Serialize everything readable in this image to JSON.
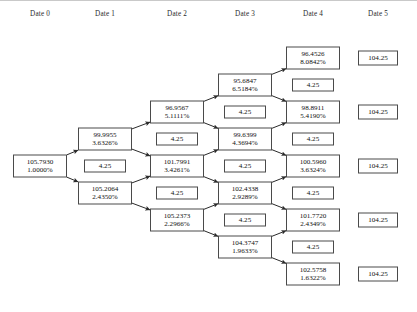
{
  "figure": {
    "type": "binomial-interest-rate-tree",
    "border_color": "#c9c9c9",
    "node_border_color": "#4a4a4a",
    "edge_color": "#2b2b2b"
  },
  "headers": [
    {
      "label": "Date 0",
      "x": 40
    },
    {
      "label": "Date 1",
      "x": 105
    },
    {
      "label": "Date 2",
      "x": 177
    },
    {
      "label": "Date 3",
      "x": 245
    },
    {
      "label": "Date 4",
      "x": 313
    },
    {
      "label": "Date 5",
      "x": 378
    }
  ],
  "columns": [
    {
      "date": "Date 0",
      "x": 40,
      "nodes": [
        {
          "kind": "price",
          "value": "105.7930",
          "rate": "1.0000%",
          "y": 166
        }
      ]
    },
    {
      "date": "Date 1",
      "x": 105,
      "nodes": [
        {
          "kind": "price",
          "value": "99.9955",
          "rate": "3.6326%",
          "y": 139
        },
        {
          "kind": "coupon",
          "value": "4.25",
          "y": 166
        },
        {
          "kind": "price",
          "value": "105.2064",
          "rate": "2.4350%",
          "y": 193
        }
      ]
    },
    {
      "date": "Date 2",
      "x": 177,
      "nodes": [
        {
          "kind": "price",
          "value": "96.9567",
          "rate": "5.1111%",
          "y": 112
        },
        {
          "kind": "coupon",
          "value": "4.25",
          "y": 139
        },
        {
          "kind": "price",
          "value": "101.7991",
          "rate": "3.4261%",
          "y": 166
        },
        {
          "kind": "coupon",
          "value": "4.25",
          "y": 193
        },
        {
          "kind": "price",
          "value": "105.2373",
          "rate": "2.2966%",
          "y": 220
        }
      ]
    },
    {
      "date": "Date 3",
      "x": 245,
      "nodes": [
        {
          "kind": "price",
          "value": "95.6847",
          "rate": "6.5184%",
          "y": 85
        },
        {
          "kind": "coupon",
          "value": "4.25",
          "y": 112
        },
        {
          "kind": "price",
          "value": "99.6399",
          "rate": "4.3694%",
          "y": 139
        },
        {
          "kind": "coupon",
          "value": "4.25",
          "y": 166
        },
        {
          "kind": "price",
          "value": "102.4338",
          "rate": "2.9289%",
          "y": 193
        },
        {
          "kind": "coupon",
          "value": "4.25",
          "y": 220
        },
        {
          "kind": "price",
          "value": "104.3747",
          "rate": "1.9633%",
          "y": 247
        }
      ]
    },
    {
      "date": "Date 4",
      "x": 313,
      "nodes": [
        {
          "kind": "price",
          "value": "96.4526",
          "rate": "8.0842%",
          "y": 58
        },
        {
          "kind": "coupon",
          "value": "4.25",
          "y": 85
        },
        {
          "kind": "price",
          "value": "98.8911",
          "rate": "5.4190%",
          "y": 112
        },
        {
          "kind": "coupon",
          "value": "4.25",
          "y": 139
        },
        {
          "kind": "price",
          "value": "100.5960",
          "rate": "3.6324%",
          "y": 166
        },
        {
          "kind": "coupon",
          "value": "4.25",
          "y": 193
        },
        {
          "kind": "price",
          "value": "101.7720",
          "rate": "2.4349%",
          "y": 220
        },
        {
          "kind": "coupon",
          "value": "4.25",
          "y": 247
        },
        {
          "kind": "price",
          "value": "102.5758",
          "rate": "1.6322%",
          "y": 274
        }
      ]
    },
    {
      "date": "Date 5",
      "x": 378,
      "nodes": [
        {
          "kind": "terminal",
          "value": "104.25",
          "y": 58
        },
        {
          "kind": "terminal",
          "value": "104.25",
          "y": 112
        },
        {
          "kind": "terminal",
          "value": "104.25",
          "y": 166
        },
        {
          "kind": "terminal",
          "value": "104.25",
          "y": 220
        },
        {
          "kind": "terminal",
          "value": "104.25",
          "y": 274
        }
      ]
    }
  ],
  "edges": [
    {
      "x1": 40,
      "y1": 166,
      "x2": 105,
      "y2": 139
    },
    {
      "x1": 40,
      "y1": 166,
      "x2": 105,
      "y2": 193
    },
    {
      "x1": 105,
      "y1": 139,
      "x2": 177,
      "y2": 112
    },
    {
      "x1": 105,
      "y1": 139,
      "x2": 177,
      "y2": 166
    },
    {
      "x1": 105,
      "y1": 193,
      "x2": 177,
      "y2": 166
    },
    {
      "x1": 105,
      "y1": 193,
      "x2": 177,
      "y2": 220
    },
    {
      "x1": 177,
      "y1": 112,
      "x2": 245,
      "y2": 85
    },
    {
      "x1": 177,
      "y1": 112,
      "x2": 245,
      "y2": 139
    },
    {
      "x1": 177,
      "y1": 166,
      "x2": 245,
      "y2": 139
    },
    {
      "x1": 177,
      "y1": 166,
      "x2": 245,
      "y2": 193
    },
    {
      "x1": 177,
      "y1": 220,
      "x2": 245,
      "y2": 193
    },
    {
      "x1": 177,
      "y1": 220,
      "x2": 245,
      "y2": 247
    },
    {
      "x1": 245,
      "y1": 85,
      "x2": 313,
      "y2": 58
    },
    {
      "x1": 245,
      "y1": 85,
      "x2": 313,
      "y2": 112
    },
    {
      "x1": 245,
      "y1": 139,
      "x2": 313,
      "y2": 112
    },
    {
      "x1": 245,
      "y1": 139,
      "x2": 313,
      "y2": 166
    },
    {
      "x1": 245,
      "y1": 193,
      "x2": 313,
      "y2": 166
    },
    {
      "x1": 245,
      "y1": 193,
      "x2": 313,
      "y2": 220
    },
    {
      "x1": 245,
      "y1": 247,
      "x2": 313,
      "y2": 220
    },
    {
      "x1": 245,
      "y1": 247,
      "x2": 313,
      "y2": 274
    }
  ]
}
